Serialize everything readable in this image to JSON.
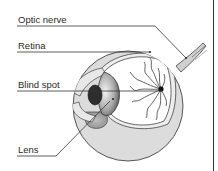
{
  "diagram": {
    "labels": [
      {
        "id": "optic-nerve",
        "text": "Optic nerve"
      },
      {
        "id": "retina",
        "text": "Retina"
      },
      {
        "id": "blind-spot",
        "text": "Blind spot"
      },
      {
        "id": "lens",
        "text": "Lens"
      }
    ],
    "colors": {
      "background": "#ffffff",
      "line": "#3a3a3a",
      "sclera_fill": "#d9d9d9",
      "interior_fill": "#ffffff",
      "iris_fill": "#2e2e2e",
      "lens_fill": "#8a8a8a",
      "border": "#333333"
    }
  }
}
